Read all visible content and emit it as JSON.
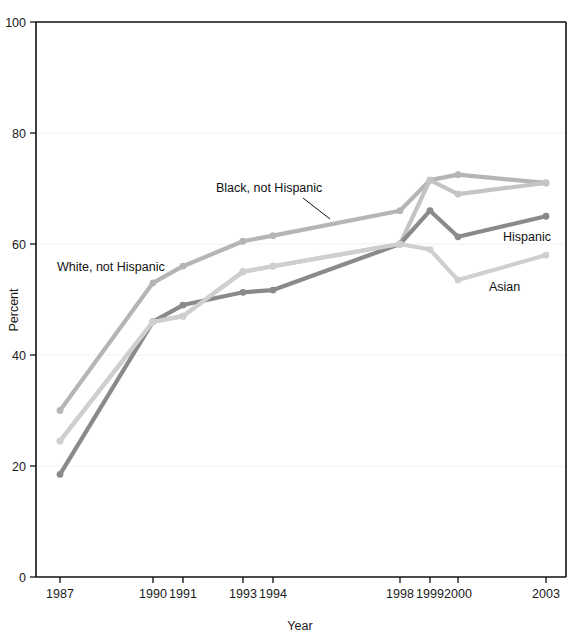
{
  "chart_data": {
    "type": "line",
    "title": "",
    "xlabel": "Year",
    "ylabel": "Percent",
    "ylim": [
      0,
      100
    ],
    "yticks": [
      0,
      20,
      40,
      60,
      80,
      100
    ],
    "ytick_labels": [
      "0",
      "20",
      "40",
      "60",
      "80",
      "100"
    ],
    "x": [
      1987,
      1990,
      1991,
      1993,
      1994,
      1998,
      1999,
      2000,
      2003
    ],
    "xtick_labels": [
      "1987",
      "1990",
      "1991",
      "1993",
      "1994",
      "1998",
      "1999",
      "2000",
      "2003"
    ],
    "grid": "horizontal-faint",
    "legend": "inline-annotations",
    "series": [
      {
        "name": "White, not Hispanic",
        "color": "#b5b5b5",
        "values": [
          30,
          53,
          56,
          60.5,
          61.5,
          66,
          71.5,
          72.5,
          71
        ]
      },
      {
        "name": "Black, not Hispanic",
        "color": "#c4c4c4",
        "values": [
          24.5,
          46,
          47,
          55,
          56,
          60,
          71.5,
          69,
          71
        ]
      },
      {
        "name": "Hispanic",
        "color": "#8a8a8a",
        "values": [
          18.5,
          46,
          49,
          51.3,
          51.7,
          60,
          66,
          61.3,
          65
        ]
      },
      {
        "name": "Asian",
        "color": "#cfcfcf",
        "values": [
          24.5,
          46,
          47,
          55,
          56,
          60,
          59,
          53.5,
          58
        ]
      }
    ],
    "annotations": [
      {
        "text": "Black, not Hispanic",
        "x_px": 216,
        "y_px": 192,
        "anchor": "start",
        "leader": {
          "x1": 303,
          "y1": 198,
          "x2": 330,
          "y2": 219
        }
      },
      {
        "text": "White, not Hispanic",
        "x_px": 57,
        "y_px": 271,
        "anchor": "start",
        "leader": null
      },
      {
        "text": "Hispanic",
        "x_px": 503,
        "y_px": 241,
        "anchor": "start",
        "leader": null
      },
      {
        "text": "Asian",
        "x_px": 489,
        "y_px": 291,
        "anchor": "start",
        "leader": null
      }
    ]
  },
  "axes": {
    "y_title": "Percent",
    "x_title": "Year"
  }
}
